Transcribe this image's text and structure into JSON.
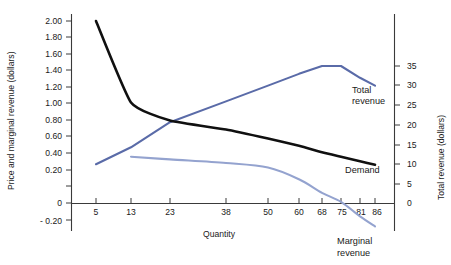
{
  "chart_data": {
    "type": "line",
    "title": "",
    "xlabel": "Quantity",
    "ylabel": "Price and marginal revenue (dollars)",
    "ylabel_right": "Total revenue (dollars)",
    "grid": false,
    "legend_position": "inline-right",
    "x_ticks": [
      "5",
      "13",
      "23",
      "38",
      "50",
      "60",
      "68",
      "75",
      "81",
      "86"
    ],
    "x_tick_values": [
      5,
      13,
      23,
      38,
      50,
      60,
      68,
      75,
      81,
      86
    ],
    "y_left_ticks": [
      "2.00",
      "1.80",
      "1.60",
      "1.40",
      "1.20",
      "1.00",
      "0.80",
      "0.60",
      "0.40",
      "0.20",
      "0",
      "- 0.20"
    ],
    "y_left_values": [
      2.0,
      1.8,
      1.6,
      1.4,
      1.2,
      1.0,
      0.8,
      0.6,
      0.4,
      0.2,
      0,
      -0.2
    ],
    "ylim_left": [
      -0.2,
      2.0
    ],
    "y_right_ticks": [
      "35",
      "30",
      "25",
      "20",
      "15",
      "10",
      "5",
      "0"
    ],
    "y_right_values": [
      35,
      30,
      25,
      20,
      15,
      10,
      5,
      0
    ],
    "ylim_right": [
      0,
      35
    ],
    "series": [
      {
        "name": "Demand",
        "label": "Demand",
        "color": "#101010",
        "axis": "left",
        "x": [
          5,
          13,
          23,
          38,
          50,
          60,
          68,
          75,
          81,
          86
        ],
        "values": [
          2.0,
          1.1,
          0.9,
          0.8,
          0.7,
          0.62,
          0.55,
          0.5,
          0.45,
          0.41
        ]
      },
      {
        "name": "Total revenue",
        "label": "Total revenue",
        "color": "#5a6ba8",
        "axis": "right",
        "x": [
          5,
          13,
          23,
          38,
          50,
          60,
          68,
          75,
          81,
          86
        ],
        "values": [
          10.0,
          14.3,
          20.7,
          26.0,
          30.0,
          33.0,
          35.0,
          35.0,
          32.0,
          30.0
        ]
      },
      {
        "name": "Marginal revenue",
        "label": "Marginal revenue",
        "color": "#94a3cf",
        "axis": "left",
        "x": [
          13,
          23,
          38,
          50,
          60,
          68,
          75,
          81,
          86
        ],
        "values": [
          0.5,
          0.47,
          0.43,
          0.38,
          0.25,
          0.1,
          0.0,
          -0.16,
          -0.27
        ]
      }
    ],
    "annotations": [
      {
        "text": "Total revenue",
        "series": "Total revenue"
      },
      {
        "text": "Demand",
        "series": "Demand"
      },
      {
        "text": "Marginal revenue",
        "series": "Marginal revenue"
      }
    ]
  }
}
